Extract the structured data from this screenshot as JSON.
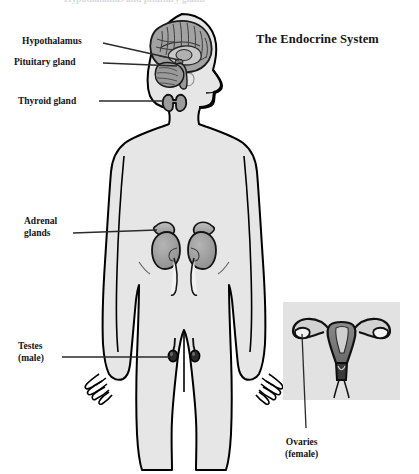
{
  "figure": {
    "title": "The Endocrine System",
    "cut_off_header": "Hypothalamus and pituitary gland",
    "background_color": "#ffffff",
    "body_fill_color": "#e6e6e6",
    "body_outline_color": "#000000",
    "organ_fill_color": "#9e9e9e",
    "organ_dark_color": "#6e6e6e",
    "inset_panel_color": "#e2e2e2",
    "leader_line_color": "#2a2a2a"
  },
  "labels": [
    {
      "id": "hypothalamus",
      "lines": [
        "Hypothalamus"
      ],
      "x": 22,
      "y": 36,
      "leader": {
        "x1": 103,
        "y1": 43,
        "x2": 178,
        "y2": 56
      }
    },
    {
      "id": "pituitary-gland",
      "lines": [
        "Pituitary gland"
      ],
      "x": 14,
      "y": 57,
      "leader": {
        "x1": 103,
        "y1": 63,
        "x2": 182,
        "y2": 63
      }
    },
    {
      "id": "thyroid-gland",
      "lines": [
        "Thyroid gland"
      ],
      "x": 18,
      "y": 96,
      "leader": {
        "x1": 99,
        "y1": 101,
        "x2": 164,
        "y2": 101
      }
    },
    {
      "id": "adrenal-glands",
      "lines": [
        "Adrenal",
        "glands"
      ],
      "x": 24,
      "y": 216,
      "leader": {
        "x1": 73,
        "y1": 233,
        "x2": 157,
        "y2": 233
      }
    },
    {
      "id": "testes",
      "lines": [
        "Testes",
        "(male)"
      ],
      "x": 18,
      "y": 341,
      "leader": {
        "x1": 62,
        "y1": 357,
        "x2": 170,
        "y2": 357
      }
    },
    {
      "id": "ovaries",
      "lines": [
        "Ovaries",
        "(female)"
      ],
      "x": 285,
      "y": 437,
      "leader": {
        "x1": 306,
        "y1": 430,
        "x2": 306,
        "y2": 412
      }
    }
  ],
  "anatomy": {
    "body_silhouette": "male-figure-anterior",
    "organs": [
      {
        "name": "brain",
        "region": "head"
      },
      {
        "name": "cerebellum",
        "region": "head"
      },
      {
        "name": "hypothalamus",
        "region": "head"
      },
      {
        "name": "pituitary-gland",
        "region": "head"
      },
      {
        "name": "thyroid-gland",
        "region": "neck"
      },
      {
        "name": "adrenal-gland-left",
        "region": "abdomen"
      },
      {
        "name": "adrenal-gland-right",
        "region": "abdomen"
      },
      {
        "name": "kidney-left",
        "region": "abdomen"
      },
      {
        "name": "kidney-right",
        "region": "abdomen"
      },
      {
        "name": "ureter-left",
        "region": "abdomen"
      },
      {
        "name": "ureter-right",
        "region": "abdomen"
      },
      {
        "name": "testis-left",
        "region": "pelvis"
      },
      {
        "name": "testis-right",
        "region": "pelvis"
      }
    ]
  },
  "inset": {
    "id": "female-reproductive-inset",
    "panel": {
      "x": 283,
      "y": 302,
      "width": 117,
      "height": 98
    },
    "organs": [
      {
        "name": "uterus"
      },
      {
        "name": "fallopian-tube-left"
      },
      {
        "name": "fallopian-tube-right"
      },
      {
        "name": "ovary-left"
      },
      {
        "name": "ovary-right"
      },
      {
        "name": "cervix"
      },
      {
        "name": "vagina"
      }
    ]
  }
}
